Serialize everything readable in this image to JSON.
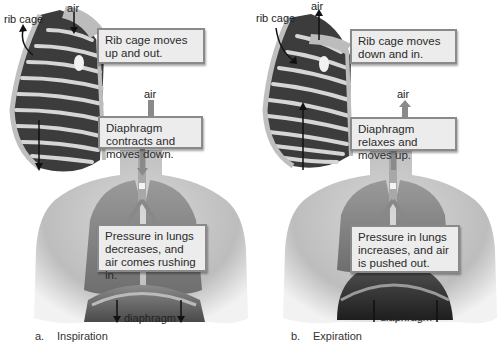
{
  "figure": {
    "panels": [
      {
        "id": "a",
        "caption_letter": "a.",
        "caption_title": "Inspiration",
        "labels": {
          "rib_cage": "rib cage",
          "air_top": "air",
          "air_mid": "air",
          "diaphragm": "diaphragm"
        },
        "boxes": [
          "Rib cage moves up and out.",
          "Diaphragm contracts and moves down.",
          "Pressure in lungs decreases, and air comes rushing in."
        ],
        "arrows": {
          "air_direction": "down",
          "rib_cage_direction": "up-out",
          "diaphragm_direction": "down"
        }
      },
      {
        "id": "b",
        "caption_letter": "b.",
        "caption_title": "Expiration",
        "labels": {
          "rib_cage": "rib cage",
          "air_top": "air",
          "air_mid": "air",
          "diaphragm": "diaphragm"
        },
        "boxes": [
          "Rib cage moves down and in.",
          "Diaphragm relaxes and moves up.",
          "Pressure in lungs increases, and air is pushed out."
        ],
        "arrows": {
          "air_direction": "up",
          "rib_cage_direction": "down-in",
          "diaphragm_direction": "up"
        }
      }
    ],
    "colors": {
      "box_fill": "#ececec",
      "box_border": "#8a8a8a",
      "skin": "#c9c9c9",
      "lung": "#8f8f8f",
      "rib_dark": "#3c3c3c",
      "rib_light": "#d6d6d6",
      "arrow": "#111111"
    }
  }
}
